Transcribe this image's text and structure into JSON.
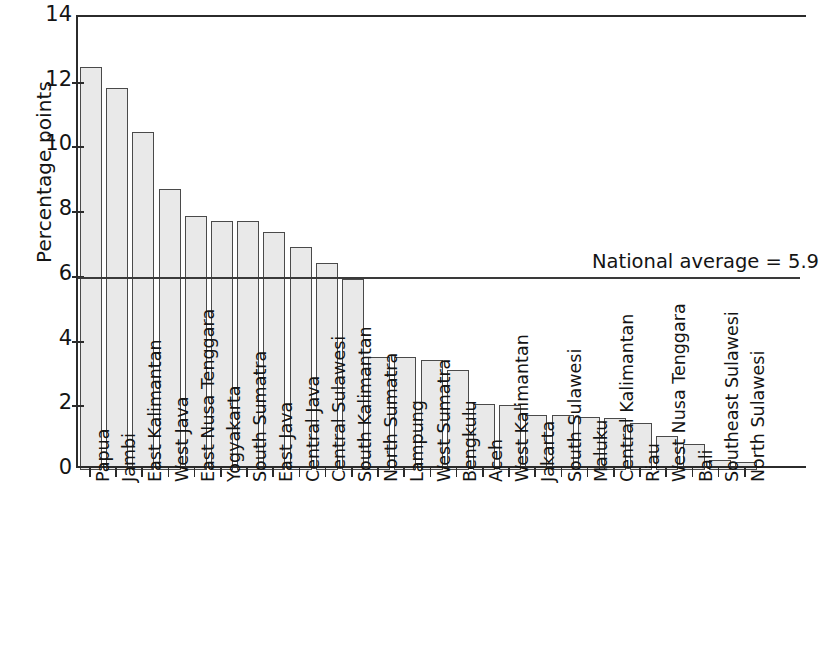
{
  "chart_data": {
    "type": "bar",
    "title": "",
    "xlabel": "",
    "ylabel": "Percentage points",
    "ylim": [
      0,
      14
    ],
    "yticks": [
      0,
      2,
      4,
      6,
      8,
      10,
      12,
      14
    ],
    "grid": false,
    "legend": null,
    "categories": [
      "Papua",
      "Jambi",
      "East Kalimantan",
      "West Java",
      "East Nusa Tenggara",
      "Yogyakarta",
      "South Sumatra",
      "East Java",
      "Central Java",
      "Central Sulawesi",
      "South Kalimantan",
      "North Sumatra",
      "Lampung",
      "West Sumatra",
      "Bengkulu",
      "Aceh",
      "West Kalimantan",
      "Jakarta",
      "South Sulawesi",
      "Maluku",
      "Central Kalimantan",
      "Riau",
      "West Nusa Tenggara",
      "Bali",
      "Southeast Sulawesi",
      "North Sulawesi"
    ],
    "values": [
      12.45,
      11.8,
      10.45,
      8.7,
      7.85,
      7.7,
      7.7,
      7.35,
      6.9,
      6.4,
      5.9,
      3.5,
      3.5,
      3.4,
      3.1,
      2.05,
      2.0,
      1.7,
      1.7,
      1.65,
      1.6,
      1.45,
      1.05,
      0.8,
      0.3,
      0.25
    ],
    "annotations": [
      {
        "name": "national-average",
        "label": "National average = 5.9",
        "value": 5.9,
        "type": "hline"
      }
    ],
    "colors": {
      "bar_fill": "#e9e9e9",
      "bar_edge": "#4a4a4a",
      "axis": "#2b2b2b",
      "text": "#141414",
      "average_line": "#3a3a3a"
    }
  }
}
